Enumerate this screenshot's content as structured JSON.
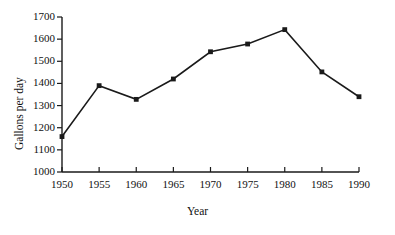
{
  "chart_data": {
    "type": "line",
    "title": "",
    "xlabel": "Year",
    "ylabel": "Gallons per day",
    "x": [
      1950,
      1955,
      1960,
      1965,
      1970,
      1975,
      1980,
      1985,
      1990
    ],
    "values": [
      1160,
      1390,
      1328,
      1420,
      1543,
      1578,
      1643,
      1452,
      1340
    ],
    "series": [
      {
        "name": "Gallons per day",
        "values": [
          1160,
          1390,
          1328,
          1420,
          1543,
          1578,
          1643,
          1452,
          1340
        ]
      }
    ],
    "xlim": [
      1950,
      1990
    ],
    "ylim": [
      1000,
      1700
    ],
    "xticks": [
      1950,
      1955,
      1960,
      1965,
      1970,
      1975,
      1980,
      1985,
      1990
    ],
    "yticks": [
      1000,
      1100,
      1200,
      1300,
      1400,
      1500,
      1600,
      1700
    ],
    "xtick_labels": [
      "1950",
      "1955",
      "1960",
      "1965",
      "1970",
      "1975",
      "1980",
      "1985",
      "1990"
    ],
    "ytick_labels": [
      "1000",
      "1100",
      "1200",
      "1300",
      "1400",
      "1500",
      "1600",
      "1700"
    ],
    "grid": false,
    "legend": null,
    "legend_position": "none",
    "marker": "filled-square",
    "line_color": "#1a1a1a",
    "marker_color": "#1a1a1a",
    "axis_color": "#1a1a1a",
    "background_color": "#ffffff"
  }
}
